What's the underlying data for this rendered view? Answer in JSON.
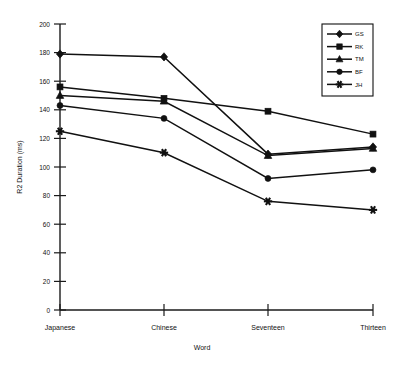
{
  "chart_data": {
    "type": "line",
    "title": "",
    "xlabel": "Word",
    "ylabel": "R2 Duration (ms)",
    "categories": [
      "Japanese",
      "Chinese",
      "Seventeen",
      "Thirteen"
    ],
    "ylim": [
      0,
      200
    ],
    "yticks": [
      0,
      20,
      40,
      60,
      80,
      100,
      120,
      140,
      160,
      180,
      200
    ],
    "grid": false,
    "legend_position": "top-right",
    "series": [
      {
        "name": "GS",
        "marker": "diamond",
        "values": [
          179,
          177,
          109,
          114
        ]
      },
      {
        "name": "RK",
        "marker": "square",
        "values": [
          156,
          148,
          139,
          123
        ]
      },
      {
        "name": "TM",
        "marker": "triangle",
        "values": [
          150,
          146,
          108,
          113
        ]
      },
      {
        "name": "BF",
        "marker": "circle",
        "values": [
          143,
          134,
          92,
          98
        ]
      },
      {
        "name": "JH",
        "marker": "star",
        "values": [
          125,
          110,
          76,
          70
        ]
      }
    ]
  },
  "axis": {
    "y_label": "R2 Duration (ms)",
    "x_label": "Word",
    "y_tick_labels": [
      "200",
      "180",
      "160",
      "140",
      "120",
      "100",
      "80",
      "60",
      "40",
      "20",
      "0"
    ],
    "x_tick_labels": [
      "Japanese",
      "Chinese",
      "Seventeen",
      "Thirteen"
    ]
  },
  "legend": {
    "entries": [
      "GS",
      "RK",
      "TM",
      "BF",
      "JH"
    ]
  },
  "colors": {
    "ink": "#111111",
    "background": "#ffffff"
  }
}
